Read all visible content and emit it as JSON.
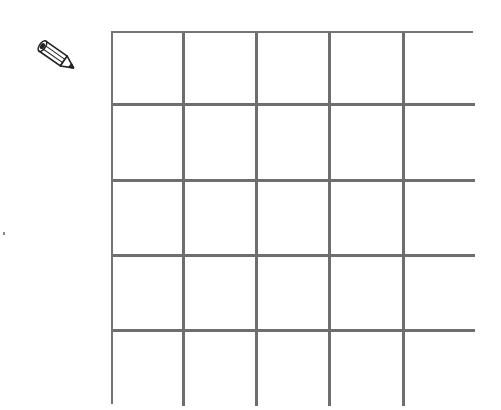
{
  "tool": {
    "icon": "pencil-icon",
    "mode": "pencil"
  },
  "grid": {
    "rows": 5,
    "cols": 5,
    "line_color": "#6e6e6e",
    "cells": [
      [
        "",
        "",
        "",
        "",
        ""
      ],
      [
        "",
        "",
        "",
        "",
        ""
      ],
      [
        "",
        "",
        "",
        "",
        ""
      ],
      [
        "",
        "",
        "",
        "",
        ""
      ],
      [
        "",
        "",
        "",
        "",
        ""
      ]
    ]
  }
}
